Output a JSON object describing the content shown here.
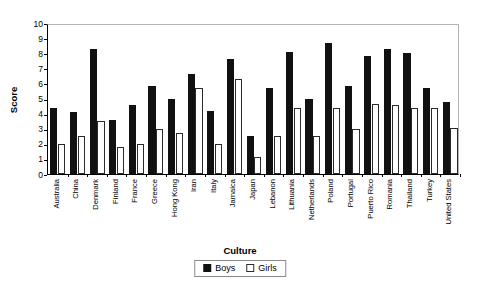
{
  "chart_data": {
    "type": "bar",
    "title": "",
    "xlabel": "Culture",
    "ylabel": "Score",
    "ylim": [
      0,
      10
    ],
    "ytick_step": 1,
    "yticks": [
      0,
      1,
      2,
      3,
      4,
      5,
      6,
      7,
      8,
      9,
      10
    ],
    "grid": false,
    "legend_position": "bottom-center",
    "categories": [
      "Australia",
      "China",
      "Denmark",
      "Finland",
      "France",
      "Greece",
      "Hong Kong",
      "Iran",
      "Italy",
      "Jamaica",
      "Japan",
      "Lebanon",
      "Lithuania",
      "Netherlands",
      "Poland",
      "Portugal",
      "Puerto Rico",
      "Romania",
      "Thailand",
      "Turkey",
      "United States"
    ],
    "series": [
      {
        "name": "Boys",
        "color": "#111111",
        "values": [
          4.4,
          4.1,
          8.3,
          3.6,
          4.6,
          5.8,
          5.0,
          6.6,
          4.2,
          7.6,
          2.5,
          5.7,
          8.1,
          5.0,
          8.7,
          5.8,
          7.8,
          8.3,
          8.0,
          5.7,
          4.8
        ]
      },
      {
        "name": "Girls",
        "color": "#ffffff",
        "values": [
          2.0,
          2.5,
          3.5,
          1.8,
          2.0,
          3.0,
          2.7,
          5.7,
          2.0,
          6.3,
          1.1,
          2.55,
          4.4,
          2.55,
          4.4,
          3.0,
          4.65,
          4.55,
          4.4,
          4.4,
          3.05
        ]
      }
    ]
  },
  "legend": {
    "items": [
      {
        "label": "Boys",
        "swatch": "filled-black-square-icon"
      },
      {
        "label": "Girls",
        "swatch": "hollow-white-square-icon"
      }
    ]
  },
  "axes": {
    "y_title": "Score",
    "x_title": "Culture"
  }
}
